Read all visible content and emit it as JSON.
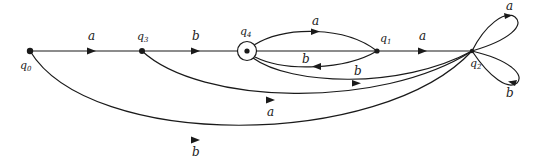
{
  "diagram": {
    "type": "finite-automaton",
    "states": [
      {
        "id": "q0",
        "name": "q",
        "sub": "0",
        "x": 30,
        "y": 51,
        "accepting": false
      },
      {
        "id": "q3",
        "name": "q",
        "sub": "3",
        "x": 142,
        "y": 51,
        "accepting": false
      },
      {
        "id": "q4",
        "name": "q",
        "sub": "4",
        "x": 247,
        "y": 51,
        "accepting": true
      },
      {
        "id": "q1",
        "name": "q",
        "sub": "1",
        "x": 377,
        "y": 51,
        "accepting": false
      },
      {
        "id": "q2",
        "name": "q",
        "sub": "2",
        "x": 472,
        "y": 51,
        "accepting": false
      }
    ],
    "edges": [
      {
        "from": "q0",
        "to": "q3",
        "label": "a"
      },
      {
        "from": "q3",
        "to": "q4",
        "label": "b"
      },
      {
        "from": "q4",
        "to": "q1",
        "label": "a"
      },
      {
        "from": "q1",
        "to": "q4",
        "label": "b"
      },
      {
        "from": "q1",
        "to": "q2",
        "label": "a"
      },
      {
        "from": "q4",
        "to": "q2",
        "label": "b"
      },
      {
        "from": "q3",
        "to": "q2",
        "label": "a"
      },
      {
        "from": "q0",
        "to": "q2",
        "label": "b"
      },
      {
        "from": "q2",
        "to": "q2",
        "label": "a"
      },
      {
        "from": "q2",
        "to": "q2",
        "label": "b"
      }
    ],
    "colors": {
      "stroke": "#1a1a1a",
      "background": "#ffffff"
    }
  }
}
